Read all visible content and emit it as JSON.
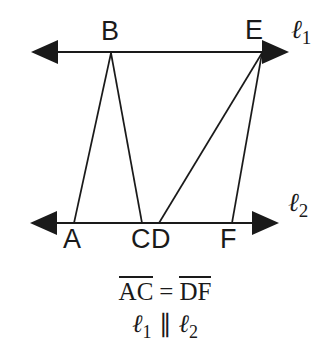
{
  "figure": {
    "type": "geometry-diagram",
    "background_color": "#ffffff",
    "stroke_color": "#1a1a1a",
    "points": [
      {
        "id": "A",
        "label": "A",
        "x": 74,
        "y": 223
      },
      {
        "id": "B",
        "label": "B",
        "x": 111,
        "y": 52
      },
      {
        "id": "C",
        "label": "C",
        "x": 142,
        "y": 223
      },
      {
        "id": "D",
        "label": "D",
        "x": 159,
        "y": 223
      },
      {
        "id": "E",
        "label": "E",
        "x": 262,
        "y": 52
      },
      {
        "id": "F",
        "label": "F",
        "x": 232,
        "y": 223
      }
    ],
    "lines": {
      "l1": {
        "label": "ℓ",
        "subscript": "1",
        "y": 52,
        "x_left_tip": 31,
        "x_right_tip": 289
      },
      "l2": {
        "label": "ℓ",
        "subscript": "2",
        "y": 223,
        "x_left_tip": 30,
        "x_right_tip": 279
      }
    },
    "segments": [
      {
        "from": "B",
        "to": "A"
      },
      {
        "from": "B",
        "to": "C"
      },
      {
        "from": "E",
        "to": "D"
      },
      {
        "from": "E",
        "to": "F"
      }
    ],
    "line_label_positions": {
      "l1": {
        "x": 291,
        "y": 17
      },
      "l2": {
        "x": 288,
        "y": 190
      }
    },
    "point_label_positions": {
      "A": {
        "x": 63,
        "y": 226
      },
      "B": {
        "x": 101,
        "y": 18
      },
      "C": {
        "x": 131,
        "y": 226
      },
      "D": {
        "x": 151,
        "y": 226
      },
      "E": {
        "x": 245,
        "y": 17
      },
      "F": {
        "x": 220,
        "y": 226
      }
    }
  },
  "caption": {
    "line1": {
      "left_segment": "AC",
      "relation": "=",
      "right_segment": "DF"
    },
    "line2": {
      "left_line": "ℓ",
      "left_sub": "1",
      "relation": "∥",
      "right_line": "ℓ",
      "right_sub": "2"
    }
  }
}
